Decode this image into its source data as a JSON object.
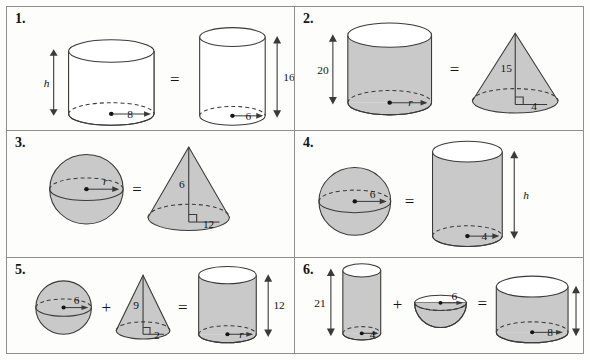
{
  "page": {
    "background_color": "#fdfdfb",
    "border_color": "#8f8f8f",
    "shape_fill_gray": "#c9c9c9",
    "shape_fill_white": "#ffffff",
    "stroke_color": "#3a3a3a"
  },
  "problems": [
    {
      "number": "1.",
      "operator_equals": "=",
      "shapes": [
        {
          "kind": "cylinder",
          "shaded": false,
          "height_label": "h",
          "height_italic": true,
          "radius_label": "8",
          "radius_italic": false
        },
        {
          "kind": "cylinder",
          "shaded": false,
          "height_label": "16",
          "height_italic": false,
          "radius_label": "6",
          "radius_italic": false
        }
      ]
    },
    {
      "number": "2.",
      "operator_equals": "=",
      "shapes": [
        {
          "kind": "cylinder",
          "shaded": true,
          "height_label": "20",
          "height_italic": false,
          "radius_label": "r",
          "radius_italic": true
        },
        {
          "kind": "cone",
          "shaded": true,
          "height_label": "15",
          "height_italic": false,
          "radius_label": "4",
          "radius_italic": false,
          "right_angle_marker": true
        }
      ]
    },
    {
      "number": "3.",
      "operator_equals": "=",
      "shapes": [
        {
          "kind": "sphere",
          "shaded": true,
          "radius_label": "r",
          "radius_italic": true
        },
        {
          "kind": "cone",
          "shaded": true,
          "height_label": "6",
          "height_italic": false,
          "radius_label": "12",
          "radius_italic": false,
          "right_angle_marker": true
        }
      ]
    },
    {
      "number": "4.",
      "operator_equals": "=",
      "shapes": [
        {
          "kind": "sphere",
          "shaded": true,
          "radius_label": "6",
          "radius_italic": false
        },
        {
          "kind": "cylinder",
          "shaded": true,
          "height_label": "h",
          "height_italic": true,
          "radius_label": "4",
          "radius_italic": false
        }
      ]
    },
    {
      "number": "5.",
      "operator_plus": "+",
      "operator_equals": "=",
      "shapes": [
        {
          "kind": "sphere",
          "shaded": true,
          "radius_label": "6",
          "radius_italic": false
        },
        {
          "kind": "cone",
          "shaded": true,
          "height_label": "9",
          "height_italic": false,
          "radius_label": "2",
          "radius_italic": false,
          "right_angle_marker": true
        },
        {
          "kind": "cylinder",
          "shaded": true,
          "height_label": "12",
          "height_italic": false,
          "radius_label": "r",
          "radius_italic": true
        }
      ]
    },
    {
      "number": "6.",
      "operator_plus": "+",
      "operator_equals": "=",
      "shapes": [
        {
          "kind": "cylinder",
          "shaded": true,
          "height_label": "21",
          "height_italic": false,
          "radius_label": "4",
          "radius_italic": false
        },
        {
          "kind": "hemisphere",
          "shaded": true,
          "radius_label": "6",
          "radius_italic": false
        },
        {
          "kind": "cylinder",
          "shaded": true,
          "height_label": "h",
          "height_italic": true,
          "radius_label": "8",
          "radius_italic": false
        }
      ]
    }
  ]
}
